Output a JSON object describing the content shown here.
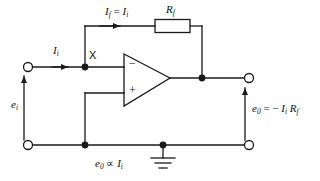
{
  "figure": {
    "name": "inverting-operational-amplifier-current-to-voltage-converter",
    "background_color": "#ffffff",
    "line_color": "#1a1a1a"
  },
  "labels": {
    "feedback_current": {
      "symbol": "I",
      "sub": "f",
      "relation": "=",
      "symbol2": "I",
      "sub2": "i"
    },
    "feedback_resistor": {
      "symbol": "R",
      "sub": "f"
    },
    "input_current": {
      "symbol": "I",
      "sub": "i"
    },
    "summing_node": {
      "text": "X"
    },
    "input_voltage": {
      "symbol": "e",
      "sub": "i"
    },
    "output_voltage_equation": {
      "symbol": "e",
      "sub": "0",
      "relation": "=",
      "sign": "−",
      "symbol2": "I",
      "sub2": "i",
      "symbol3": "R",
      "sub3": "f"
    },
    "proportionality": {
      "symbol": "e",
      "sub": "0",
      "relation": "∝",
      "symbol2": "I",
      "sub2": "i"
    },
    "opamp_inverting_input": {
      "text": "−"
    },
    "opamp_noninverting_input": {
      "text": "+"
    }
  },
  "components": {
    "opamp": {
      "name": "operational-amplifier",
      "shape": "triangle"
    },
    "resistor": {
      "name": "feedback-resistor-rf",
      "shape": "rectangle"
    },
    "ground": {
      "name": "ground-symbol",
      "bars": 3
    },
    "terminals": [
      {
        "name": "input-terminal-top",
        "type": "open-circle"
      },
      {
        "name": "input-terminal-bottom",
        "type": "open-circle"
      },
      {
        "name": "output-terminal-top",
        "type": "open-circle"
      },
      {
        "name": "output-terminal-bottom",
        "type": "open-circle"
      }
    ],
    "junctions": [
      {
        "name": "junction-node-x",
        "type": "filled-dot"
      },
      {
        "name": "junction-output-node",
        "type": "filled-dot"
      },
      {
        "name": "junction-noninverting-return",
        "type": "filled-dot"
      },
      {
        "name": "junction-ground-rail",
        "type": "filled-dot"
      }
    ]
  }
}
